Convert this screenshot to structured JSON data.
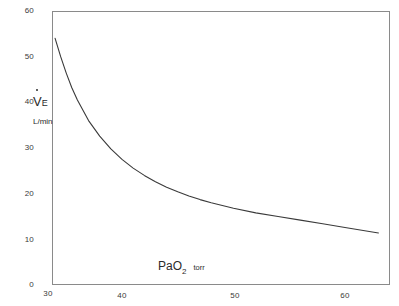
{
  "chart_data": {
    "type": "line",
    "title": "",
    "subtitle": "",
    "xlabel": "PaO2",
    "xlabel_main": "PaO",
    "xlabel_sub": "2",
    "xunits": "torr",
    "ylabel": "VE",
    "ylabel_letter": "V",
    "ylabel_sub": "E",
    "yunits": "L/min",
    "xlim": [
      30,
      63
    ],
    "ylim": [
      0,
      60
    ],
    "xticks": [
      30,
      40,
      50,
      60
    ],
    "yticks": [
      0,
      10,
      20,
      30,
      40,
      50,
      60
    ],
    "xtick_labels": [
      "30",
      "40",
      "50",
      "60"
    ],
    "ytick_labels": [
      "0",
      "10",
      "20",
      "30",
      "40",
      "50",
      "60"
    ],
    "grid": false,
    "legend": false,
    "legend_position": "none",
    "series": [
      {
        "name": "hypoxic ventilatory response",
        "x": [
          34.0,
          34.5,
          35.0,
          35.5,
          36.0,
          37.0,
          38.0,
          39.0,
          40.0,
          41.0,
          42.0,
          43.0,
          44.0,
          45.0,
          46.0,
          47.0,
          48.0,
          50.0,
          52.0,
          54.0,
          56.0,
          58.0,
          60.0,
          63.0
        ],
        "y": [
          54.0,
          50.0,
          46.4,
          43.2,
          40.5,
          36.0,
          32.6,
          29.8,
          27.5,
          25.6,
          24.0,
          22.6,
          21.4,
          20.4,
          19.5,
          18.7,
          18.0,
          16.8,
          15.8,
          15.0,
          14.2,
          13.4,
          12.6,
          11.4
        ]
      }
    ],
    "annotations": [],
    "colors": {
      "curve": "#3a3a3a",
      "frame": "#8a8a8a",
      "text": "#2b2b2b",
      "background": "#ffffff"
    }
  }
}
